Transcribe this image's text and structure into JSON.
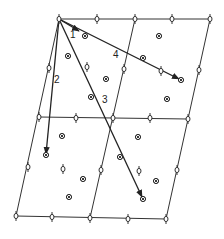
{
  "diagram": {
    "type": "oblique lattice with vectors",
    "colors": {
      "line": "#333333",
      "background": "#ffffff"
    },
    "origin": [
      59,
      19
    ],
    "lattice_rows": [
      [
        [
          59,
          19
        ],
        [
          97,
          19
        ],
        [
          135,
          19
        ],
        [
          172,
          19
        ],
        [
          210,
          19
        ]
      ],
      [
        [
          39,
          117
        ],
        [
          76,
          118
        ],
        [
          113,
          118
        ],
        [
          150,
          118
        ],
        [
          188,
          119
        ]
      ],
      [
        [
          16,
          216
        ],
        [
          52,
          217
        ],
        [
          90,
          218
        ],
        [
          128,
          219
        ],
        [
          166,
          219
        ]
      ]
    ],
    "grid_lines": [
      [
        [
          59,
          19
        ],
        [
          210,
          19
        ]
      ],
      [
        [
          39,
          117
        ],
        [
          188,
          119
        ]
      ],
      [
        [
          16,
          216
        ],
        [
          166,
          219
        ]
      ],
      [
        [
          59,
          19
        ],
        [
          16,
          216
        ]
      ],
      [
        [
          135,
          19
        ],
        [
          90,
          218
        ]
      ],
      [
        [
          210,
          19
        ],
        [
          166,
          219
        ]
      ]
    ],
    "edge_midpoints": [
      [
        49,
        68
      ],
      [
        28,
        167
      ],
      [
        124,
        69
      ],
      [
        101,
        170
      ],
      [
        199,
        70
      ],
      [
        177,
        170
      ]
    ],
    "interior_open_markers": [
      [
        87,
        67
      ],
      [
        161,
        71
      ],
      [
        63,
        169
      ],
      [
        139,
        171
      ]
    ],
    "circled_x_markers": [
      [
        85,
        36
      ],
      [
        68,
        56
      ],
      [
        106,
        79
      ],
      [
        91,
        97
      ],
      [
        159,
        36
      ],
      [
        143,
        58
      ],
      [
        181,
        80
      ],
      [
        167,
        99
      ],
      [
        62,
        136
      ],
      [
        46,
        155
      ],
      [
        83,
        179
      ],
      [
        69,
        197
      ],
      [
        138,
        137
      ],
      [
        120,
        157
      ],
      [
        156,
        181
      ],
      [
        143,
        199
      ]
    ],
    "vectors": [
      {
        "label": "1",
        "from": [
          59,
          19
        ],
        "to": [
          79,
          31
        ],
        "label_pos": [
          70,
          30
        ]
      },
      {
        "label": "2",
        "from": [
          59,
          19
        ],
        "to": [
          46,
          154
        ],
        "label_pos": [
          55,
          74
        ]
      },
      {
        "label": "3",
        "from": [
          59,
          19
        ],
        "to": [
          142,
          197
        ],
        "label_pos": [
          102,
          94
        ]
      },
      {
        "label": "4",
        "from": [
          59,
          19
        ],
        "to": [
          179,
          79
        ],
        "label_pos": [
          114,
          50
        ]
      }
    ]
  }
}
